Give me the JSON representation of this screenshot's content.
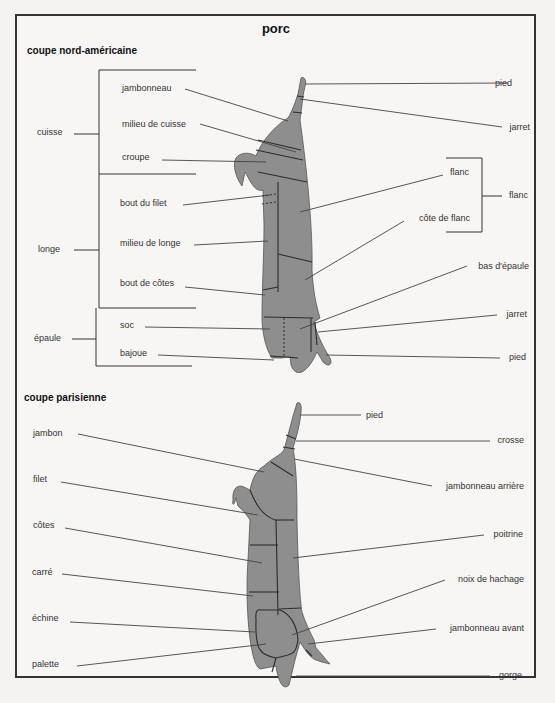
{
  "title": "porc",
  "colors": {
    "meat": "#8e8e8e",
    "line": "#444444",
    "background": "#f7f6f4"
  },
  "north_american": {
    "heading": "coupe nord-américaine",
    "groups": [
      {
        "label": "cuisse"
      },
      {
        "label": "longe"
      },
      {
        "label": "épaule"
      },
      {
        "label": "flanc"
      }
    ],
    "left_labels": [
      "jambonneau",
      "milieu de cuisse",
      "croupe",
      "bout du filet",
      "milieu de longe",
      "bout de côtes",
      "soc",
      "bajoue"
    ],
    "right_labels": [
      "pied",
      "jarret",
      "flanc",
      "côte de flanc",
      "bas d'épaule",
      "jarret",
      "pied"
    ]
  },
  "parisian": {
    "heading": "coupe parisienne",
    "left_labels": [
      "jambon",
      "filet",
      "côtes",
      "carré",
      "échine",
      "palette"
    ],
    "right_labels": [
      "pied",
      "crosse",
      "jambonneau arrière",
      "poitrine",
      "noix de hachage",
      "jambonneau avant",
      "gorge"
    ]
  }
}
